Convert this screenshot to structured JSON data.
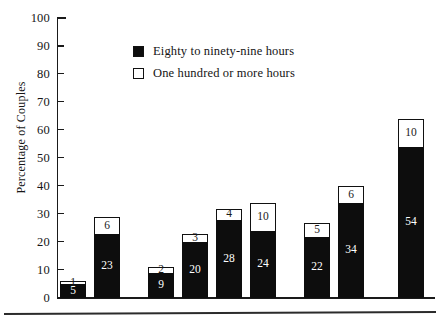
{
  "chart_data": {
    "type": "bar",
    "subtype": "stacked",
    "title": "",
    "xlabel": "",
    "ylabel": "Percentage of Couples",
    "ylim": [
      0,
      100
    ],
    "yticks": [
      0,
      10,
      20,
      30,
      40,
      50,
      60,
      70,
      80,
      90,
      100
    ],
    "grid": false,
    "legend_position": "top-center",
    "series": [
      {
        "name": "Eighty to ninety-nine hours",
        "color": "#0d0d0d",
        "values": [
          5,
          23,
          9,
          20,
          28,
          24,
          22,
          34,
          54
        ]
      },
      {
        "name": "One hundred or more hours",
        "color": "#ffffff",
        "values": [
          1,
          6,
          2,
          3,
          4,
          10,
          5,
          6,
          10
        ]
      }
    ],
    "bars": [
      {
        "bottom": 5,
        "top": 1,
        "total": 6
      },
      {
        "bottom": 23,
        "top": 6,
        "total": 29
      },
      {
        "bottom": 9,
        "top": 2,
        "total": 11
      },
      {
        "bottom": 20,
        "top": 3,
        "total": 23
      },
      {
        "bottom": 28,
        "top": 4,
        "total": 32
      },
      {
        "bottom": 24,
        "top": 10,
        "total": 34
      },
      {
        "bottom": 22,
        "top": 5,
        "total": 27
      },
      {
        "bottom": 34,
        "top": 6,
        "total": 40
      },
      {
        "bottom": 54,
        "top": 10,
        "total": 64
      }
    ]
  },
  "axis": {
    "y_title": "Percentage of Couples",
    "tick_labels": [
      "100",
      "90",
      "80",
      "70",
      "60",
      "50",
      "40",
      "30",
      "20",
      "10",
      "0"
    ]
  },
  "legend": {
    "items": [
      {
        "label": "Eighty to ninety-nine hours",
        "swatch": "filled-square"
      },
      {
        "label": "One hundred or more hours",
        "swatch": "hollow-square"
      }
    ]
  }
}
